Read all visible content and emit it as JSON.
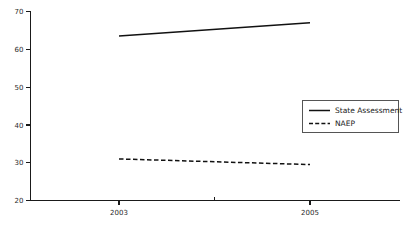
{
  "chart_data": {
    "type": "line",
    "title": "",
    "subtitle": "",
    "xlabel": "",
    "ylabel": "",
    "x": [
      "2003",
      "2004",
      "2005"
    ],
    "x_tick_labels": [
      "2003",
      "",
      "2005"
    ],
    "xlim": [
      2003,
      2005
    ],
    "ylim": [
      20,
      70
    ],
    "y_ticks": [
      20,
      30,
      40,
      50,
      60,
      70
    ],
    "grid": false,
    "legend_position": "center-right",
    "series": [
      {
        "name": "State Assessment",
        "style": "solid",
        "color": "#111111",
        "x": [
          "2003",
          "2005"
        ],
        "values": [
          63.5,
          67
        ]
      },
      {
        "name": "NAEP",
        "style": "dashed",
        "color": "#111111",
        "x": [
          "2003",
          "2005"
        ],
        "values": [
          31,
          29.5
        ]
      }
    ],
    "annotations": []
  },
  "axes": {
    "y_tick_labels": [
      "70",
      "60",
      "50",
      "40",
      "30",
      "20"
    ],
    "x_tick_labels": [
      "2003",
      "2005"
    ]
  },
  "legend": {
    "entries": [
      {
        "label": "State Assessment",
        "style": "solid"
      },
      {
        "label": "NAEP",
        "style": "dashed"
      }
    ]
  },
  "colors": {
    "background": "#ffffff",
    "axis": "#1a1a1a",
    "series": "#111111",
    "legend_border": "#555555",
    "tick_text": "#2a2a2a"
  }
}
